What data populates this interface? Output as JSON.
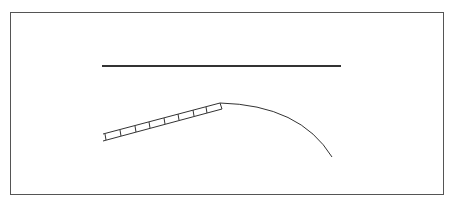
{
  "diagram": {
    "colors": {
      "background": "#ffffff",
      "frame": "#555555",
      "line": "#333333"
    },
    "elements": [
      {
        "name": "horizontal-line",
        "type": "line"
      },
      {
        "name": "ladder-segment",
        "type": "ladder",
        "rungs": 8
      },
      {
        "name": "curve-segment",
        "type": "curve"
      }
    ]
  }
}
